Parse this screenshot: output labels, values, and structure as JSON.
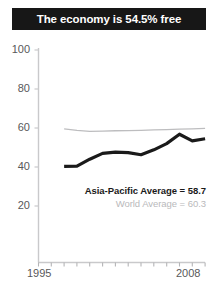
{
  "title": {
    "text": "The economy is 54.5% free",
    "background_color": "#171717",
    "text_color": "#ffffff"
  },
  "legend": {
    "asia_pacific": "Asia-Pacific Average = 58.7",
    "world": "World Average = 60.3",
    "asia_pacific_color": "#1a1a1a",
    "world_color": "#b9b9bb"
  },
  "axis": {
    "y_ticks": [
      "100",
      "80",
      "60",
      "40",
      "20"
    ],
    "x_tick_start": "1995",
    "x_tick_end": "2008",
    "tick_color": "#58585a"
  },
  "chart_data": {
    "type": "line",
    "title": "The economy is 54.5% free",
    "xlabel": "",
    "ylabel": "",
    "xlim": [
      1995,
      2008
    ],
    "ylim": [
      0,
      100
    ],
    "yticks": [
      20,
      40,
      60,
      80,
      100
    ],
    "xticks": [
      1995,
      1996,
      1997,
      1998,
      1999,
      2000,
      2001,
      2002,
      2003,
      2004,
      2005,
      2006,
      2007,
      2008
    ],
    "grid": false,
    "legend_position": "inside-right",
    "x": [
      1997,
      1998,
      1999,
      2000,
      2001,
      2002,
      2003,
      2004,
      2005,
      2006,
      2007,
      2008
    ],
    "series": [
      {
        "name": "Asia-Pacific Average",
        "label": "Asia-Pacific Average = 58.7",
        "color": "#1a1a1a",
        "width": 3.2,
        "final_value": 54.5,
        "values": [
          40.3,
          40.4,
          44.0,
          47.0,
          47.6,
          47.4,
          46.3,
          48.8,
          52.0,
          56.8,
          53.4,
          54.5
        ]
      },
      {
        "name": "World Average",
        "label": "World Average = 60.3",
        "color": "#bdbdbf",
        "width": 1.3,
        "final_value": 60.3,
        "values": [
          59.6,
          58.8,
          58.3,
          58.4,
          58.6,
          58.7,
          58.8,
          59.0,
          59.2,
          59.4,
          59.6,
          59.8
        ]
      }
    ],
    "annotations": [
      {
        "text": "Asia-Pacific Average = 58.7",
        "value": 58.7
      },
      {
        "text": "World Average = 60.3",
        "value": 60.3
      }
    ]
  }
}
